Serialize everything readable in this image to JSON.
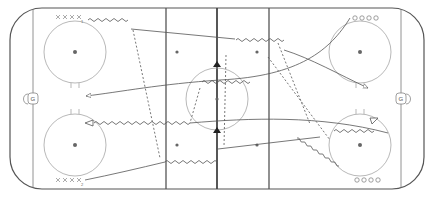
{
  "diagram": {
    "rink": {
      "goal_left_label": "G",
      "goal_right_label": "G"
    },
    "players": {
      "top_left_group": {
        "type": "X",
        "count": 4,
        "subscript": "1"
      },
      "bottom_left_group": {
        "type": "X",
        "count": 4,
        "subscript": "2"
      },
      "top_right_group": {
        "type": "O",
        "count": 4
      },
      "bottom_right_group": {
        "type": "O",
        "count": 4
      }
    },
    "cones": [
      {
        "position": "center-top"
      },
      {
        "position": "center-bottom"
      }
    ],
    "labels": {
      "x1_sub": "1",
      "x2_sub": "2"
    },
    "colors": {
      "line": "#555555",
      "circle": "#999999",
      "cone": "#222222"
    }
  }
}
